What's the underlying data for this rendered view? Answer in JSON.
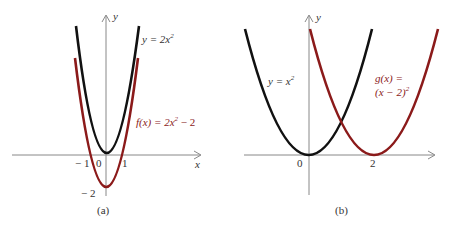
{
  "colors": {
    "base_curve": "#111111",
    "transformed_curve": "#8b1a1a",
    "axis": "#888888",
    "text": "#333333"
  },
  "panel_a": {
    "caption": "(a)",
    "x_axis_label": "x",
    "y_axis_label": "y",
    "tick_neg1": "− 1",
    "tick_0": "0",
    "tick_1": "1",
    "tick_neg2": "− 2",
    "base_label_lhs": "y = 2x",
    "base_label_exp": "2",
    "transformed_label_lhs": "f(x) = 2x",
    "transformed_label_exp": "2",
    "transformed_label_rhs": " − 2"
  },
  "panel_b": {
    "caption": "(b)",
    "y_axis_label": "y",
    "tick_0": "0",
    "tick_2": "2",
    "base_label_lhs": "y = x",
    "base_label_exp": "2",
    "transformed_label_line1": "g(x) =",
    "transformed_label_line2": "(x − 2)",
    "transformed_label_exp": "2"
  }
}
